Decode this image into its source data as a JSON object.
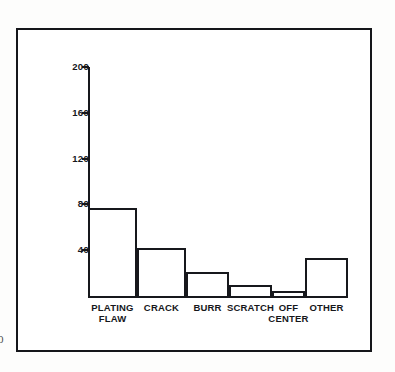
{
  "page": {
    "margin_mark": "0"
  },
  "chart_data": {
    "type": "bar",
    "title": "",
    "subtitle": "",
    "xlabel": "",
    "ylabel": "",
    "categories": [
      "PLATING\nFLAW",
      "CRACK",
      "BURR",
      "SCRATCH",
      "OFF\nCENTER",
      "OTHER"
    ],
    "category_labels_flat": [
      "PLATING FLAW",
      "CRACK",
      "BURR",
      "SCRATCH",
      "OFF CENTER",
      "OTHER"
    ],
    "values": [
      77,
      42,
      21,
      10,
      4,
      33
    ],
    "ylim": [
      0,
      200
    ],
    "yticks": [
      40,
      80,
      120,
      160,
      200
    ],
    "ytick_labels": [
      "40",
      "80",
      "120",
      "160",
      "200"
    ],
    "grid": false,
    "legend": null,
    "annotations": [],
    "colors": {
      "bar_fill": "#ffffff",
      "bar_stroke": "#17181c",
      "axis": "#17181c",
      "text": "#16171b",
      "background": "#ffffff",
      "frame": "#15161a"
    }
  },
  "geometry": {
    "baseline_y": 296,
    "top_value_y": 67,
    "axis_left_x": 88,
    "bar_left_x": [
      88,
      137,
      186,
      229,
      272,
      305
    ],
    "bar_right_x": [
      137,
      186,
      229,
      272,
      305,
      348
    ]
  }
}
